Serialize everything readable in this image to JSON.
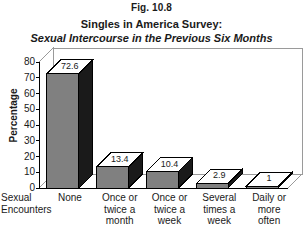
{
  "figure": {
    "number_label": "Fig. 10.8",
    "title_line1": "Singles in America Survey:",
    "title_line2": "Sexual Intercourse in the Previous Six Months",
    "title_line3": "(Divorced Singles)"
  },
  "axes": {
    "y_title": "Percentage",
    "x_title_line1": "Sexual",
    "x_title_line2": "Encounters"
  },
  "colors": {
    "bar_face": "#808080",
    "bar_side": "#1a1a1a",
    "bar_top": "#ffffff",
    "outline": "#000000",
    "plot_background": "#ffffff",
    "text": "#1a1a1a"
  },
  "chart_data": {
    "type": "bar",
    "title": "Singles in America Survey: Sexual Intercourse in the Previous Six Months (Divorced Singles)",
    "xlabel": "Sexual Encounters",
    "ylabel": "Percentage",
    "ylim": [
      0,
      80
    ],
    "yticks": [
      0,
      10,
      20,
      30,
      40,
      50,
      60,
      70,
      80
    ],
    "ytick_labels": [
      "0",
      "10",
      "20",
      "30",
      "40",
      "50",
      "60",
      "70",
      "80"
    ],
    "grid": false,
    "legend": false,
    "three_d": true,
    "categories": [
      "None",
      "Once or twice a month",
      "Once or twice a week",
      "Several times a week",
      "Daily or more often"
    ],
    "category_lines": [
      [
        "None"
      ],
      [
        "Once or",
        "twice a",
        "month"
      ],
      [
        "Once or",
        "twice a",
        "week"
      ],
      [
        "Several",
        "times a",
        "week"
      ],
      [
        "Daily or",
        "more",
        "often"
      ]
    ],
    "values": [
      72.6,
      13.4,
      10.4,
      2.9,
      1
    ],
    "value_labels": [
      "72.6",
      "13.4",
      "10.4",
      "2.9",
      "1"
    ]
  }
}
